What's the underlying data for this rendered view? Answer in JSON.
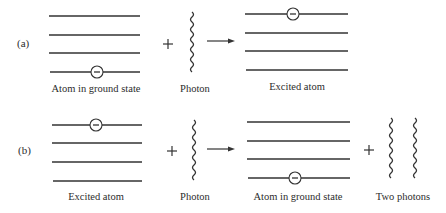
{
  "figure": {
    "panels": [
      {
        "tag": "(a)",
        "left_atom_label": "Atom in ground state",
        "photon_label": "Photon",
        "right_atom_label": "Excited atom",
        "plus": "+",
        "description": "Absorption: atom in ground state + photon -> excited atom"
      },
      {
        "tag": "(b)",
        "left_atom_label": "Excited atom",
        "photon_label": "Photon",
        "right_atom_label": "Atom in ground state",
        "plus": "+",
        "plus2": "+",
        "product_label": "Two photons",
        "description": "Stimulated emission: excited atom + photon -> atom in ground state + two photons"
      }
    ],
    "electron_symbol": "−",
    "colors": {
      "line": "#333333",
      "background": "#ffffff"
    }
  }
}
